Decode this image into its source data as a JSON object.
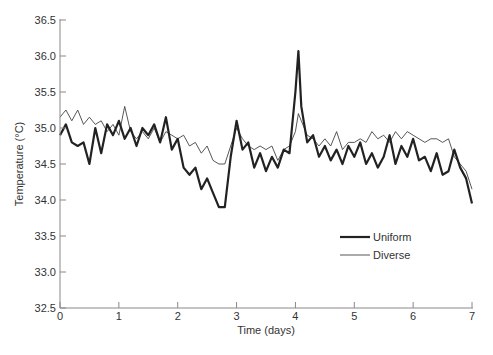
{
  "chart_data": {
    "type": "line",
    "title": "",
    "xlabel": "Time (days)",
    "ylabel": "Temperature (°C)",
    "xlim": [
      0,
      7
    ],
    "ylim": [
      32.5,
      36.5
    ],
    "xticks": [
      0,
      1,
      2,
      3,
      4,
      5,
      6,
      7
    ],
    "yticks": [
      32.5,
      33.0,
      33.5,
      34.0,
      34.5,
      35.0,
      35.5,
      36.0,
      36.5
    ],
    "ytick_labels": [
      "32.5",
      "33.0",
      "33.5",
      "34.0",
      "34.5",
      "35.0",
      "35.5",
      "36.0",
      "36.5"
    ],
    "grid": false,
    "legend_position": "lower right (inside plot)",
    "x": [
      0.0,
      0.1,
      0.2,
      0.3,
      0.4,
      0.5,
      0.6,
      0.7,
      0.8,
      0.9,
      1.0,
      1.1,
      1.2,
      1.3,
      1.4,
      1.5,
      1.6,
      1.7,
      1.8,
      1.9,
      2.0,
      2.1,
      2.2,
      2.3,
      2.4,
      2.5,
      2.6,
      2.7,
      2.8,
      2.9,
      3.0,
      3.1,
      3.2,
      3.3,
      3.4,
      3.5,
      3.6,
      3.7,
      3.8,
      3.9,
      4.0,
      4.05,
      4.1,
      4.2,
      4.3,
      4.4,
      4.5,
      4.6,
      4.7,
      4.8,
      4.9,
      5.0,
      5.1,
      5.2,
      5.3,
      5.4,
      5.5,
      5.6,
      5.7,
      5.8,
      5.9,
      6.0,
      6.1,
      6.2,
      6.3,
      6.4,
      6.5,
      6.6,
      6.7,
      6.8,
      6.9,
      7.0
    ],
    "series": [
      {
        "name": "Uniform",
        "style": "thick",
        "color": "#222222",
        "values": [
          34.9,
          35.05,
          34.8,
          34.75,
          34.8,
          34.5,
          35.0,
          34.65,
          35.05,
          34.9,
          35.1,
          34.85,
          35.0,
          34.75,
          35.0,
          34.9,
          35.05,
          34.8,
          35.15,
          34.7,
          34.85,
          34.45,
          34.35,
          34.45,
          34.15,
          34.3,
          34.1,
          33.9,
          33.9,
          34.6,
          35.1,
          34.7,
          34.8,
          34.45,
          34.65,
          34.4,
          34.6,
          34.45,
          34.7,
          34.65,
          35.5,
          36.07,
          35.3,
          34.8,
          34.9,
          34.6,
          34.75,
          34.55,
          34.7,
          34.5,
          34.75,
          34.6,
          34.8,
          34.5,
          34.65,
          34.45,
          34.6,
          34.9,
          34.5,
          34.75,
          34.6,
          34.85,
          34.55,
          34.6,
          34.4,
          34.65,
          34.35,
          34.4,
          34.7,
          34.45,
          34.3,
          33.95
        ]
      },
      {
        "name": "Diverse",
        "style": "thin",
        "color": "#444444",
        "values": [
          35.15,
          35.25,
          35.1,
          35.25,
          35.05,
          35.15,
          35.05,
          35.1,
          34.95,
          35.05,
          34.9,
          35.3,
          34.95,
          34.85,
          34.95,
          34.85,
          35.0,
          34.8,
          34.95,
          34.9,
          34.85,
          34.9,
          34.75,
          34.8,
          34.65,
          34.75,
          34.55,
          34.5,
          34.5,
          34.75,
          35.0,
          34.85,
          34.75,
          34.7,
          34.75,
          34.7,
          34.75,
          34.55,
          34.7,
          34.75,
          34.95,
          35.2,
          35.1,
          34.9,
          34.85,
          34.75,
          34.85,
          34.75,
          34.95,
          34.7,
          34.8,
          34.8,
          34.85,
          34.8,
          34.95,
          34.85,
          34.9,
          34.8,
          34.95,
          34.85,
          34.95,
          34.9,
          34.85,
          34.8,
          34.85,
          34.85,
          34.8,
          34.85,
          34.6,
          34.5,
          34.4,
          34.15
        ]
      }
    ]
  },
  "legend": {
    "items": [
      {
        "label": "Uniform",
        "stroke_width": 2.2
      },
      {
        "label": "Diverse",
        "stroke_width": 0.9
      }
    ]
  },
  "axes": {
    "x_title": "Time (days)",
    "y_title": "Temperature (°C)",
    "axis_color": "#888888"
  }
}
